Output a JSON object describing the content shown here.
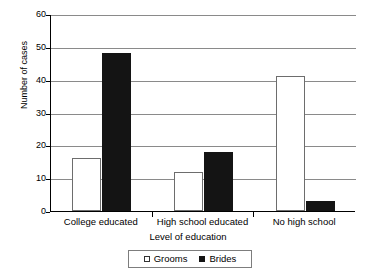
{
  "chart_data": {
    "type": "bar",
    "title": "",
    "xlabel": "Level of education",
    "ylabel": "Number of cases",
    "categories": [
      "College educated",
      "High school educated",
      "No high school"
    ],
    "series": [
      {
        "name": "Grooms",
        "values": [
          16,
          12,
          41
        ],
        "color": "#ffffff",
        "marker": "open-square"
      },
      {
        "name": "Brides",
        "values": [
          48,
          18,
          3
        ],
        "color": "#141414",
        "marker": "filled-square"
      }
    ],
    "ylim": [
      0,
      60
    ],
    "yticks": [
      0,
      10,
      20,
      30,
      40,
      50,
      60
    ],
    "ytick_labels": [
      "0",
      "10",
      "20",
      "30",
      "40",
      "50",
      "60"
    ],
    "grid": "horizontal",
    "legend_position": "bottom-center"
  },
  "legend": {
    "items": [
      {
        "label": "Grooms"
      },
      {
        "label": "Brides"
      }
    ]
  },
  "axes": {
    "y_title": "Number of cases",
    "x_title": "Level of education"
  }
}
